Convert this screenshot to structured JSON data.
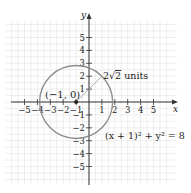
{
  "chart_data": {
    "type": "line",
    "title": "",
    "xlabel": "x",
    "ylabel": "y",
    "xlim": [
      -6,
      6
    ],
    "ylim": [
      -6,
      6
    ],
    "grid": true,
    "x_ticks": [
      -5,
      -4,
      -3,
      -2,
      -1,
      1,
      2,
      3,
      4,
      5
    ],
    "y_ticks": [
      -5,
      -4,
      -3,
      -2,
      -1,
      1,
      2,
      3,
      4,
      5
    ],
    "x_tick_labels": [
      "−5",
      "−4",
      "−3",
      "−2",
      "−1",
      "1",
      "2",
      "3",
      "4",
      "5"
    ],
    "y_tick_labels": [
      "−5",
      "−4",
      "−3",
      "−2",
      "−1",
      "1",
      "2",
      "3",
      "4",
      "5"
    ],
    "circle": {
      "center": [
        -1,
        0
      ],
      "radius": 2.8284
    },
    "center_label": "(−1, 0)",
    "radius_label": "2√2 units",
    "radius_label_parts": {
      "coef": "2",
      "radical": "√",
      "radicand": "2",
      "unit": " units"
    },
    "equation_label": "(x + 1)² + y² = 8",
    "radius_endpoint": [
      1,
      2
    ]
  },
  "colors": {
    "grid": "#dcdcdc",
    "axis": "#333333",
    "circle": "#8a8a8a",
    "radius": "#9a9a9a",
    "point": "#222222"
  }
}
